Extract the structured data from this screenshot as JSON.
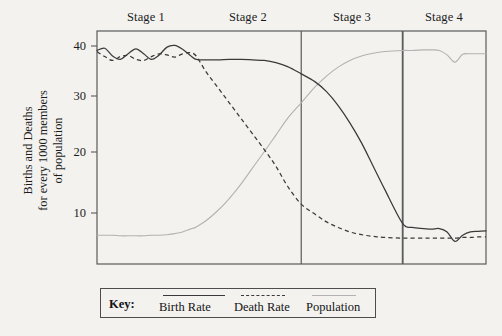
{
  "figure": {
    "title": "",
    "y_axis_title_lines": [
      "Births and Deaths",
      "for every 1000 members",
      "of population"
    ]
  },
  "stages": [
    {
      "label": "Stage 1",
      "center_x": 146
    },
    {
      "label": "Stage 2",
      "center_x": 248
    },
    {
      "label": "Stage 3",
      "center_x": 352
    },
    {
      "label": "Stage 4",
      "center_x": 444
    }
  ],
  "y_ticks": [
    {
      "label": "40",
      "value": 40
    },
    {
      "label": "30",
      "value": 30
    },
    {
      "label": "20",
      "value": 20
    },
    {
      "label": "10",
      "value": 10
    }
  ],
  "key": {
    "title": "Key:",
    "items": [
      {
        "label": "Birth Rate",
        "style": "solid",
        "color": "#3a3a3a"
      },
      {
        "label": "Death Rate",
        "style": "dashed",
        "color": "#3a3a3a"
      },
      {
        "label": "Population",
        "style": "solid-light",
        "color": "#b2b2b2"
      }
    ]
  },
  "chart_data": {
    "type": "line",
    "xlabel": "",
    "ylabel": "Births and Deaths for every 1000 members of population",
    "ylim": [
      0,
      42
    ],
    "xlim": [
      0,
      100
    ],
    "grid": false,
    "legend_position": "bottom",
    "stage_boundaries": [
      25.5,
      52.5,
      78.5
    ],
    "x": [
      0,
      2,
      4,
      6,
      8,
      10,
      12,
      14,
      16,
      18,
      20,
      22,
      24,
      25.5,
      28,
      31,
      34,
      37,
      40,
      43,
      46,
      49,
      52.5,
      56,
      59,
      62,
      65,
      68,
      71,
      74,
      78.5,
      81,
      84,
      86,
      88,
      90,
      92,
      94,
      96,
      98,
      100
    ],
    "series": [
      {
        "name": "Birth Rate",
        "style": "solid",
        "color": "#3a3a3a",
        "values": [
          39.2,
          39.6,
          38.2,
          37.6,
          38.6,
          39.5,
          38.6,
          37.6,
          38.4,
          39.8,
          40.1,
          39.4,
          38.3,
          37.6,
          37.5,
          37.5,
          37.6,
          37.6,
          37.5,
          37.4,
          37.0,
          36.3,
          35.0,
          33.6,
          31.8,
          29.3,
          26.2,
          22.6,
          18.4,
          14.2,
          8.2,
          7.4,
          7.2,
          7.1,
          7.2,
          6.6,
          4.9,
          6.0,
          6.6,
          6.7,
          6.8
        ]
      },
      {
        "name": "Death Rate",
        "style": "dashed",
        "color": "#3a3a3a",
        "values": [
          39.0,
          38.1,
          37.4,
          38.1,
          38.3,
          37.6,
          37.4,
          38.1,
          38.6,
          38.4,
          38.0,
          38.6,
          38.8,
          38.2,
          35.4,
          32.6,
          29.8,
          27.0,
          24.2,
          21.4,
          18.4,
          14.8,
          11.6,
          9.8,
          8.4,
          7.4,
          6.6,
          6.1,
          5.8,
          5.6,
          5.5,
          5.5,
          5.5,
          5.5,
          5.5,
          5.5,
          5.5,
          5.6,
          5.6,
          5.7,
          5.7
        ]
      },
      {
        "name": "Population",
        "style": "solid-light",
        "color": "#b2b2b2",
        "values": [
          6.0,
          6.0,
          6.0,
          5.9,
          5.9,
          5.9,
          5.9,
          6.0,
          6.0,
          6.1,
          6.3,
          6.6,
          7.1,
          7.5,
          8.6,
          10.4,
          12.6,
          15.2,
          18.1,
          21.0,
          24.0,
          27.0,
          29.8,
          32.6,
          34.6,
          36.2,
          37.4,
          38.2,
          38.7,
          39.0,
          39.2,
          39.2,
          39.3,
          39.3,
          39.2,
          38.4,
          37.1,
          38.5,
          38.6,
          38.6,
          38.6
        ]
      }
    ],
    "annotations": [
      {
        "text": "Stage 1",
        "x": 12,
        "position": "above-axis"
      },
      {
        "text": "Stage 2",
        "x": 39,
        "position": "above-axis"
      },
      {
        "text": "Stage 3",
        "x": 65,
        "position": "above-axis"
      },
      {
        "text": "Stage 4",
        "x": 89,
        "position": "above-axis"
      }
    ]
  }
}
